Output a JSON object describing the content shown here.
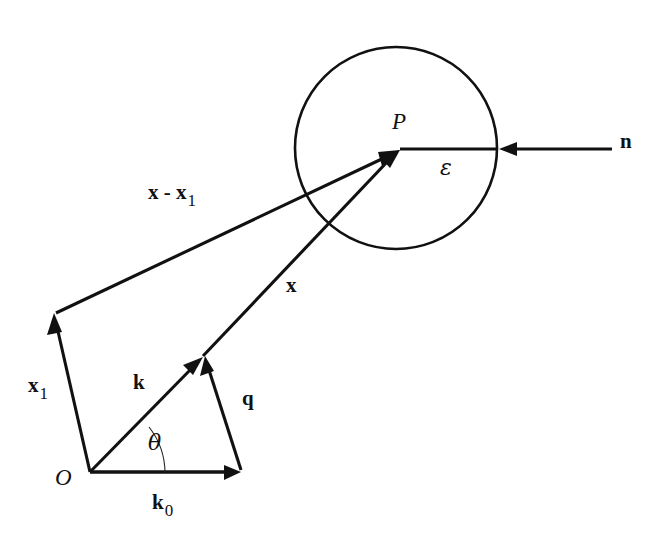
{
  "figure": {
    "background_color": "#ffffff",
    "ink_color": "#111111",
    "width": 663,
    "height": 553
  },
  "labels": {
    "point_p": "P",
    "origin": "O",
    "normal": "n",
    "epsilon": "ε",
    "theta": "θ",
    "x_vector": "x",
    "x1_vector": "x",
    "x1_subscript": "1",
    "x_minus_x1": "x - x",
    "x_minus_x1_subscript": "1",
    "k_vector": "k",
    "k0_vector": "k",
    "k0_subscript": "0",
    "q_vector": "q"
  },
  "geometry": {
    "circle": {
      "cx": 396,
      "cy": 148,
      "r": 101
    },
    "point_p": {
      "x": 400,
      "y": 150
    },
    "origin": {
      "x": 90,
      "y": 473
    },
    "x1_tip": {
      "x": 54,
      "y": 314
    },
    "k_tip": {
      "x": 203,
      "y": 357
    },
    "k0_tip": {
      "x": 240,
      "y": 473
    },
    "n_tail": {
      "x": 612,
      "y": 149
    },
    "n_tip": {
      "x": 500,
      "y": 149
    },
    "epsilon_end": {
      "x": 496,
      "y": 150
    },
    "theta_arc_radius": 75,
    "theta_degrees": 38
  },
  "label_positions": {
    "point_p": {
      "x": 392,
      "y": 110
    },
    "origin": {
      "x": 55,
      "y": 466
    },
    "normal": {
      "x": 620,
      "y": 131
    },
    "epsilon": {
      "x": 440,
      "y": 157
    },
    "theta": {
      "x": 148,
      "y": 432
    },
    "x_vector": {
      "x": 286,
      "y": 275
    },
    "x1_vector": {
      "x": 28,
      "y": 375
    },
    "x_minus_x1": {
      "x": 148,
      "y": 182
    },
    "k_vector": {
      "x": 133,
      "y": 372
    },
    "k0_vector": {
      "x": 152,
      "y": 492
    },
    "q_vector": {
      "x": 242,
      "y": 388
    }
  }
}
